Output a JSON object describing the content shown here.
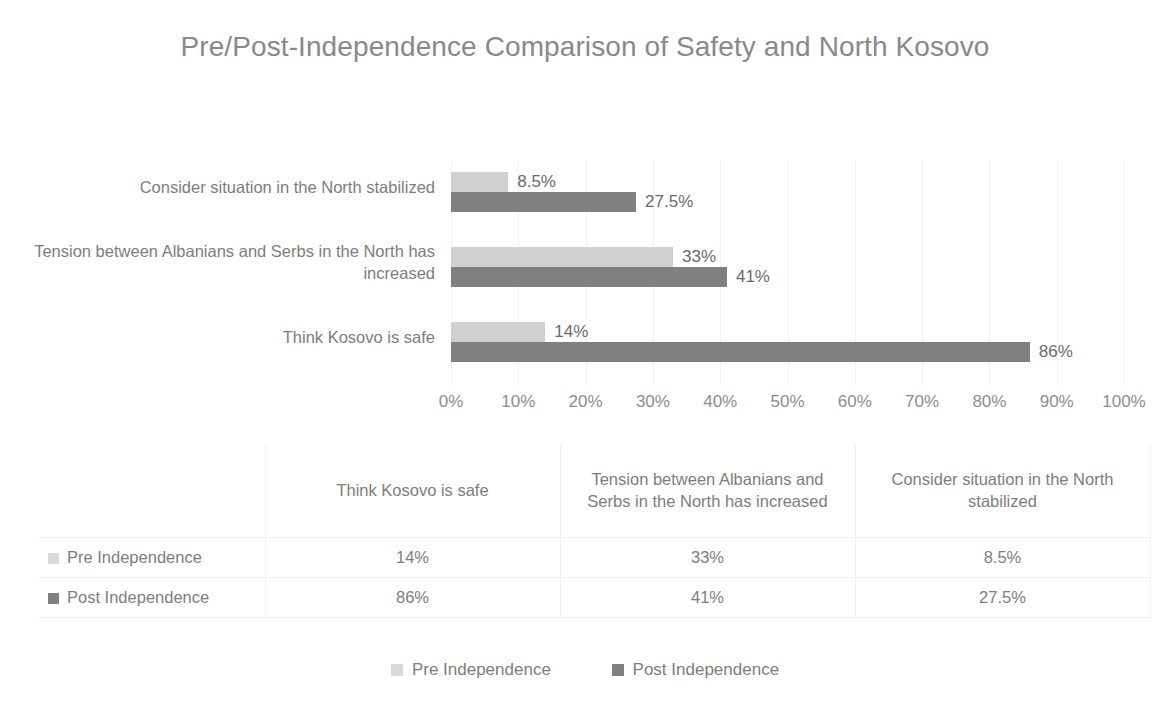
{
  "chart_data": {
    "type": "bar",
    "orientation": "horizontal",
    "title": "Pre/Post-Independence Comparison of Safety and North Kosovo",
    "xlabel": "",
    "ylabel": "",
    "xlim": [
      0,
      100
    ],
    "xticks": [
      "0%",
      "10%",
      "20%",
      "30%",
      "40%",
      "50%",
      "60%",
      "70%",
      "80%",
      "90%",
      "100%"
    ],
    "xtick_values": [
      0,
      10,
      20,
      30,
      40,
      50,
      60,
      70,
      80,
      90,
      100
    ],
    "grid": true,
    "legend_position": "bottom",
    "categories": [
      "Think Kosovo is safe",
      "Tension between Albanians and Serbs in the North has increased",
      "Consider situation in the North stabilized"
    ],
    "categories_display_top_to_bottom": [
      "Consider situation in the North stabilized",
      "Tension between Albanians and Serbs in the North has increased",
      "Think Kosovo is safe"
    ],
    "series": [
      {
        "name": "Pre Independence",
        "color": "#d0d0d0",
        "values": [
          14,
          33,
          8.5
        ],
        "labels": [
          "14%",
          "33%",
          "8.5%"
        ]
      },
      {
        "name": "Post Independence",
        "color": "#808080",
        "values": [
          86,
          41,
          27.5
        ],
        "labels": [
          "86%",
          "41%",
          "27.5%"
        ]
      }
    ]
  },
  "plot_rows": [
    {
      "category": "Consider situation in the North stabilized",
      "pre_value": 8.5,
      "pre_label": "8.5%",
      "post_value": 27.5,
      "post_label": "27.5%"
    },
    {
      "category": "Tension between Albanians and Serbs in the North has increased",
      "pre_value": 33,
      "pre_label": "33%",
      "post_value": 41,
      "post_label": "41%"
    },
    {
      "category": "Think Kosovo is safe",
      "pre_value": 14,
      "pre_label": "14%",
      "post_value": 86,
      "post_label": "86%"
    }
  ],
  "data_table": {
    "corner_label": "",
    "columns": [
      "Think Kosovo is safe",
      "Tension between Albanians and Serbs in the North has increased",
      "Consider situation in the North stabilized"
    ],
    "rows": [
      {
        "label": "Pre Independence",
        "swatch_color": "#d9d9d9",
        "values": [
          "14%",
          "33%",
          "8.5%"
        ]
      },
      {
        "label": "Post Independence",
        "swatch_color": "#808080",
        "values": [
          "86%",
          "41%",
          "27.5%"
        ]
      }
    ]
  },
  "legend": {
    "items": [
      {
        "label": "Pre Independence",
        "color": "#d9d9d9"
      },
      {
        "label": "Post Independence",
        "color": "#808080"
      }
    ]
  }
}
